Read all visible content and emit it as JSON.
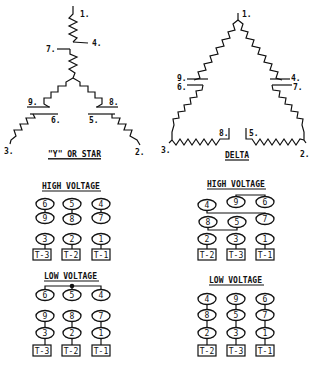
{
  "diagrams": {
    "wye": {
      "title": "\"Y\" OR STAR",
      "leads": {
        "1": "1.",
        "2": "2.",
        "3": "3.",
        "4": "4.",
        "5": "5.",
        "6": "6.",
        "7": "7.",
        "8": "8.",
        "9": "9."
      }
    },
    "delta": {
      "title": "DELTA",
      "leads": {
        "1": "1.",
        "2": "2.",
        "3": "3.",
        "4": "4.",
        "5": "5.",
        "6": "6.",
        "7": "7.",
        "8": "8.",
        "9": "9."
      }
    }
  },
  "connections": {
    "wye_high": {
      "title": "HIGH VOLTAGE",
      "rows": [
        [
          "6",
          "5",
          "4"
        ],
        [
          "9",
          "8",
          "7"
        ],
        [
          "3",
          "2",
          "1"
        ]
      ],
      "terminals": [
        "T-3",
        "T-2",
        "T-1"
      ]
    },
    "wye_low": {
      "title": "LOW VOLTAGE",
      "rows": [
        [
          "6",
          "5",
          "4"
        ],
        [
          "9",
          "8",
          "7"
        ],
        [
          "3",
          "2",
          "1"
        ]
      ],
      "terminals": [
        "T-3",
        "T-2",
        "T-1"
      ]
    },
    "delta_high": {
      "title": "HIGH VOLTAGE",
      "rows": [
        [
          "4",
          "9",
          "6"
        ],
        [
          "8",
          "5",
          "7"
        ],
        [
          "2",
          "3",
          "1"
        ]
      ],
      "terminals": [
        "T-2",
        "T-3",
        "T-1"
      ]
    },
    "delta_low": {
      "title": "LOW VOLTAGE",
      "rows": [
        [
          "4",
          "9",
          "6"
        ],
        [
          "8",
          "5",
          "7"
        ],
        [
          "2",
          "3",
          "1"
        ]
      ],
      "terminals": [
        "T-2",
        "T-3",
        "T-1"
      ]
    }
  }
}
